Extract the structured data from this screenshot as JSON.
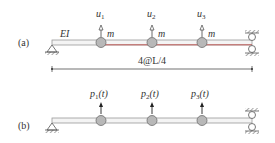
{
  "diagram": {
    "panel_a": {
      "label": "(a)",
      "stiffness_label": "EI",
      "dimension_label": "4@L/4",
      "masses": [
        {
          "disp_label": "u",
          "sub": "1",
          "mass_label": "m"
        },
        {
          "disp_label": "u",
          "sub": "2",
          "mass_label": "m"
        },
        {
          "disp_label": "u",
          "sub": "3",
          "mass_label": "m"
        }
      ],
      "left_support": "pin",
      "right_support": "roller-guided"
    },
    "panel_b": {
      "label": "(b)",
      "forces": [
        {
          "label": "p",
          "sub": "1",
          "arg": "(t)"
        },
        {
          "label": "p",
          "sub": "2",
          "arg": "(t)"
        },
        {
          "label": "p",
          "sub": "3",
          "arg": "(t)"
        }
      ],
      "left_support": "pin",
      "right_support": "roller-guided"
    },
    "colors": {
      "beam_outline": "#9a9a9a",
      "beam_deflected": "#c0504d",
      "mass_fill": "#b8b8b8",
      "mass_stroke": "#6e6e6e",
      "text": "#333333"
    }
  }
}
